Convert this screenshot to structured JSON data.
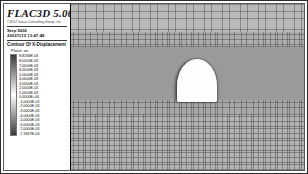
{
  "app": {
    "title": "FLAC3D 5.00",
    "copyright": "©2012 Itasca Consulting Group, Inc.",
    "step_label": "Step 5000",
    "datetime": "2022/1/12 13:47:48"
  },
  "legend": {
    "heading": "Contour Of X-Displacement",
    "plane_label": "Plane: on",
    "colorbar": {
      "top_color": "#3a3a3a",
      "mid_color": "#ffffff",
      "bottom_color": "#3a3a3a"
    },
    "values": [
      "8.8184E-03",
      "8.0000E-03",
      "7.0000E-03",
      "6.0000E-03",
      "5.0000E-03",
      "4.0000E-03",
      "3.0000E-03",
      "2.0000E-03",
      "1.0000E-03",
      "0.0000E+00",
      "-1.0000E-03",
      "-2.0000E-03",
      "-3.0000E-03",
      "-4.0000E-03",
      "-5.0000E-03",
      "-6.0000E-03",
      "-7.0000E-03",
      "-7.1847E-03"
    ]
  },
  "plot": {
    "background_color": "#9e9e9e",
    "mesh_bands": [
      {
        "name": "upper-coarse-mesh",
        "top_pct": 0,
        "height_pct": 17,
        "shade": "#b9b9b9",
        "density": "coarse"
      },
      {
        "name": "upper-fine-mesh",
        "top_pct": 17,
        "height_pct": 9,
        "shade": "#adadad",
        "density": "fine"
      },
      {
        "name": "core-mesh",
        "top_pct": 26,
        "height_pct": 32,
        "shade": "#9a9a9a",
        "density": "mid"
      },
      {
        "name": "lower-fine-mesh",
        "top_pct": 58,
        "height_pct": 8,
        "shade": "#a8a8a8",
        "density": "fine"
      },
      {
        "name": "bottom-mesh",
        "top_pct": 66,
        "height_pct": 34,
        "shade": "#b4b4b4",
        "density": "fine"
      }
    ],
    "tunnel": {
      "name": "arch-tunnel-opening",
      "left_pct": 45.5,
      "top_pct": 33,
      "width_pct": 17,
      "height_pct": 26,
      "fill_color": "#fdfdfd"
    }
  }
}
